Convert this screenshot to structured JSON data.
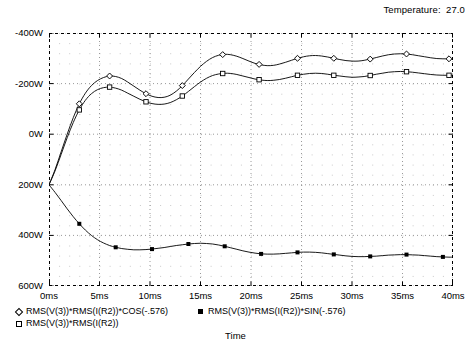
{
  "header": {
    "temperature_label": "Temperature:  27.0"
  },
  "axis": {
    "x_title": "Time",
    "y_ticks": [
      "600W",
      "400W",
      "200W",
      "0W",
      "-200W",
      "-400W"
    ],
    "x_ticks": [
      "0ms",
      "5ms",
      "10ms",
      "15ms",
      "20ms",
      "25ms",
      "30ms",
      "35ms",
      "40ms"
    ]
  },
  "legend": {
    "items": [
      {
        "label": "RMS(V(3))*RMS(I(R2))*COS(-.576)",
        "marker": "diamond-open-marker",
        "col": 0,
        "row": 0
      },
      {
        "label": "RMS(V(3))*RMS(I(R2))",
        "marker": "square-open-marker",
        "col": 0,
        "row": 1
      },
      {
        "label": "RMS(V(3))*RMS(I(R2))*SIN(-.576)",
        "marker": "square-filled-marker",
        "col": 1,
        "row": 0
      }
    ]
  },
  "chart_data": {
    "type": "line",
    "title": "",
    "xlabel": "Time",
    "ylabel": "",
    "xlim": [
      0,
      40
    ],
    "ylim": [
      -400,
      600
    ],
    "x_unit": "ms",
    "y_unit": "W",
    "grid": "dotted-minor-dashed-major",
    "legend_position": "below-axis",
    "xticks": [
      0,
      5,
      10,
      15,
      20,
      25,
      30,
      35,
      40
    ],
    "yticks": [
      -400,
      -200,
      0,
      200,
      400,
      600
    ],
    "series": [
      {
        "name": "RMS(V(3))*RMS(I(R2))*COS(-.576)",
        "marker": "diamond-open-marker",
        "x": [
          0,
          0.6,
          1.2,
          1.8,
          2.4,
          3.0,
          3.6,
          4.2,
          4.8,
          5.4,
          6.0,
          6.6,
          7.2,
          7.8,
          8.4,
          9.0,
          9.6,
          10.2,
          10.8,
          11.4,
          12.0,
          12.6,
          13.2,
          13.8,
          14.4,
          15.0,
          15.6,
          16.2,
          16.8,
          17.4,
          18.0,
          18.6,
          19.2,
          19.8,
          20.4,
          21.0,
          21.6,
          22.2,
          22.8,
          23.4,
          24.0,
          24.6,
          25.2,
          25.8,
          26.4,
          27.0,
          27.6,
          28.2,
          28.8,
          29.4,
          30.0,
          30.6,
          31.2,
          31.8,
          32.4,
          33.0,
          33.6,
          34.2,
          34.8,
          35.4,
          36.0,
          36.6,
          37.2,
          37.8,
          38.4,
          39.0,
          39.6,
          40.0
        ],
        "y": [
          0,
          60,
          130,
          200,
          265,
          320,
          362,
          392,
          412,
          424,
          430,
          428,
          420,
          406,
          390,
          374,
          360,
          350,
          345,
          346,
          354,
          370,
          392,
          418,
          444,
          468,
          488,
          503,
          512,
          516,
          514,
          508,
          499,
          489,
          480,
          474,
          471,
          472,
          477,
          484,
          492,
          500,
          506,
          510,
          511,
          509,
          505,
          500,
          495,
          491,
          489,
          489,
          492,
          497,
          503,
          509,
          514,
          517,
          518,
          517,
          514,
          510,
          506,
          502,
          499,
          498,
          498,
          499
        ],
        "markers_at": [
          3.0,
          6.0,
          9.6,
          13.2,
          17.2,
          20.8,
          24.6,
          28.2,
          31.8,
          35.4,
          39.6
        ]
      },
      {
        "name": "RMS(V(3))*RMS(I(R2))",
        "marker": "square-open-marker",
        "x": [
          0,
          0.6,
          1.2,
          1.8,
          2.4,
          3.0,
          3.6,
          4.2,
          4.8,
          5.4,
          6.0,
          6.6,
          7.2,
          7.8,
          8.4,
          9.0,
          9.6,
          10.2,
          10.8,
          11.4,
          12.0,
          12.6,
          13.2,
          13.8,
          14.4,
          15.0,
          15.6,
          16.2,
          16.8,
          17.4,
          18.0,
          18.6,
          19.2,
          19.8,
          20.4,
          21.0,
          21.6,
          22.2,
          22.8,
          23.4,
          24.0,
          24.6,
          25.2,
          25.8,
          26.4,
          27.0,
          27.6,
          28.2,
          28.8,
          29.4,
          30.0,
          30.6,
          31.2,
          31.8,
          32.4,
          33.0,
          33.6,
          34.2,
          34.8,
          35.4,
          36.0,
          36.6,
          37.2,
          37.8,
          38.4,
          39.0,
          39.6,
          40.0
        ],
        "y": [
          0,
          55,
          120,
          186,
          246,
          296,
          334,
          360,
          376,
          384,
          386,
          382,
          374,
          362,
          350,
          338,
          328,
          321,
          318,
          319,
          325,
          336,
          351,
          369,
          388,
          406,
          421,
          432,
          438,
          441,
          440,
          436,
          430,
          424,
          418,
          414,
          412,
          413,
          416,
          421,
          427,
          433,
          437,
          440,
          441,
          440,
          437,
          433,
          430,
          427,
          425,
          426,
          428,
          432,
          437,
          441,
          445,
          447,
          448,
          447,
          445,
          442,
          439,
          436,
          434,
          433,
          433,
          434
        ],
        "markers_at": [
          3.0,
          6.0,
          9.6,
          13.2,
          17.2,
          20.8,
          24.6,
          28.2,
          31.8,
          35.4,
          39.6
        ]
      },
      {
        "name": "RMS(V(3))*RMS(I(R2))*SIN(-.576)",
        "marker": "square-filled-marker",
        "x": [
          0,
          0.6,
          1.2,
          1.8,
          2.4,
          3.0,
          3.6,
          4.2,
          4.8,
          5.4,
          6.0,
          6.6,
          7.2,
          7.8,
          8.4,
          9.0,
          9.6,
          10.2,
          10.8,
          11.4,
          12.0,
          12.6,
          13.2,
          13.8,
          14.4,
          15.0,
          15.6,
          16.2,
          16.8,
          17.4,
          18.0,
          18.6,
          19.2,
          19.8,
          20.4,
          21.0,
          21.6,
          22.2,
          22.8,
          23.4,
          24.0,
          24.6,
          25.2,
          25.8,
          26.4,
          27.0,
          27.6,
          28.2,
          28.8,
          29.4,
          30.0,
          30.6,
          31.2,
          31.8,
          32.4,
          33.0,
          33.6,
          34.2,
          34.8,
          35.4,
          36.0,
          36.6,
          37.2,
          37.8,
          38.4,
          39.0,
          39.6,
          40.0
        ],
        "y": [
          0,
          -30,
          -62,
          -95,
          -126,
          -154,
          -179,
          -200,
          -217,
          -230,
          -240,
          -247,
          -252,
          -255,
          -257,
          -257,
          -256,
          -254,
          -251,
          -248,
          -244,
          -240,
          -237,
          -234,
          -232,
          -231,
          -232,
          -234,
          -238,
          -243,
          -249,
          -255,
          -261,
          -266,
          -270,
          -273,
          -274,
          -274,
          -273,
          -271,
          -269,
          -267,
          -266,
          -266,
          -267,
          -269,
          -272,
          -275,
          -278,
          -281,
          -283,
          -284,
          -284,
          -283,
          -282,
          -280,
          -278,
          -277,
          -276,
          -276,
          -277,
          -278,
          -280,
          -282,
          -284,
          -285,
          -286,
          -286
        ],
        "markers_at": [
          3.0,
          6.6,
          10.2,
          13.8,
          17.4,
          21.0,
          24.6,
          28.2,
          31.8,
          35.4,
          39.0
        ]
      }
    ]
  }
}
